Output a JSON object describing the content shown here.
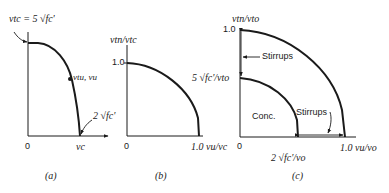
{
  "panels": {
    "a": {
      "caption": "(a)",
      "top_label": "v_tc = 5 √f'c",
      "top_label_text": "vtc = 5 √fc'",
      "point_label": "vtu, vu",
      "corner_label": "2 √fc'",
      "origin": "0",
      "x_label": "vc"
    },
    "b": {
      "caption": "(b)",
      "y_axis_label": "vtn/vtc",
      "y_tick": "1.0",
      "origin": "0",
      "x_label": "1.0 vu/vc"
    },
    "c": {
      "caption": "(c)",
      "y_axis_label": "vtn/vto",
      "y_tick": "1.0",
      "inner_y_label": "5 √fc'/vto",
      "stirrups_top": "Stirrups",
      "conc_label": "Conc.",
      "stirrups_bottom": "Stirrups",
      "origin": "0",
      "inner_x_label": "2 √fc'/vo",
      "x_label": "1.0 vu/vo"
    }
  },
  "colors": {
    "ink": "#1a1a1a",
    "background": "#ffffff"
  }
}
